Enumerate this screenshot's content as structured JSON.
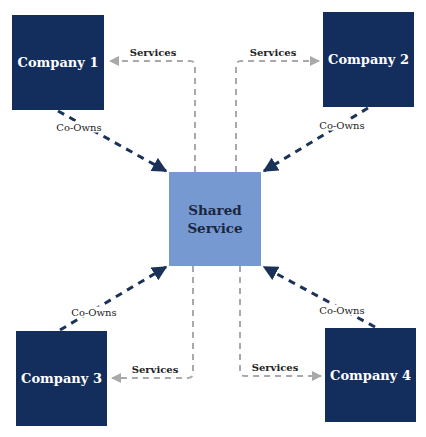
{
  "colors": {
    "company_fill": "#132d5c",
    "shared_fill": "#7799d2",
    "co_owns_line": "#1b3258",
    "services_line": "#a9a9a9"
  },
  "center": {
    "label_line1": "Shared",
    "label_line2": "Service"
  },
  "companies": [
    {
      "id": "c1",
      "label": "Company 1"
    },
    {
      "id": "c2",
      "label": "Company 2"
    },
    {
      "id": "c3",
      "label": "Company 3"
    },
    {
      "id": "c4",
      "label": "Company 4"
    }
  ],
  "edges": {
    "co_owns_label": "Co-Owns",
    "services_label": "Services"
  }
}
